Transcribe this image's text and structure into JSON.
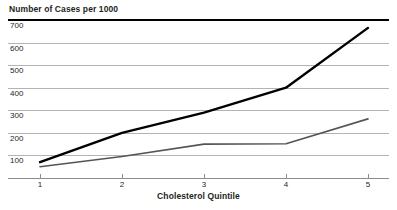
{
  "chart_data": {
    "type": "line",
    "title": "Number of Cases per 1000",
    "xlabel": "Cholesterol Quintile",
    "ylabel": "",
    "categories": [
      "1",
      "2",
      "3",
      "4",
      "5"
    ],
    "x": [
      1,
      2,
      3,
      4,
      5
    ],
    "xlim": [
      1,
      5
    ],
    "ylim": [
      0,
      700
    ],
    "yticks": [
      100,
      200,
      300,
      400,
      500,
      600,
      700
    ],
    "ytick_labels": [
      "100",
      "200",
      "300",
      "400",
      "500",
      "600",
      "700"
    ],
    "grid": true,
    "legend": "none",
    "series": [
      {
        "name": "upper-series",
        "color": "#000000",
        "values": [
          70,
          200,
          290,
          400,
          665
        ]
      },
      {
        "name": "lower-series",
        "color": "#555555",
        "values": [
          50,
          95,
          150,
          152,
          262
        ]
      }
    ]
  },
  "colors": {
    "gridline": "#b3b3b3",
    "toprule": "#000000",
    "axis": "#8c8c8c",
    "text": "#231f20"
  }
}
